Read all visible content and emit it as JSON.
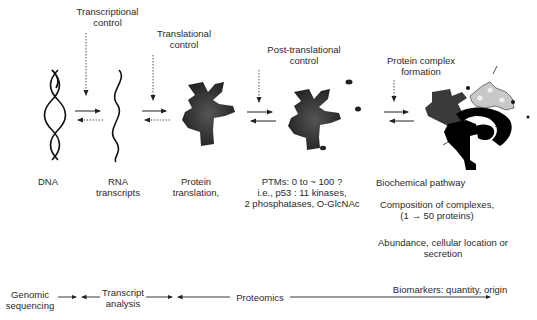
{
  "diagram": {
    "control_labels": [
      {
        "id": "transcriptional",
        "line1": "Transcriptional",
        "line2": "control"
      },
      {
        "id": "translational",
        "line1": "Translational",
        "line2": "control"
      },
      {
        "id": "post_translational",
        "line1": "Post-translational",
        "line2": "control"
      },
      {
        "id": "protein_complex",
        "line1": "Protein complex",
        "line2": "formation"
      }
    ],
    "stages": [
      {
        "id": "dna",
        "line1": "DNA",
        "line2": ""
      },
      {
        "id": "rna",
        "line1": "RNA",
        "line2": "transcripts"
      },
      {
        "id": "protein",
        "line1": "Protein",
        "line2": "translation,"
      }
    ],
    "ptm_notes": {
      "line1": "PTMs: 0 to ~ 100 ?",
      "line2": "i.e., p53 : 11 kinases,",
      "line3": "2 phosphatases, O-GlcNAc"
    },
    "complex_notes": {
      "pathway": "Biochemical pathway",
      "composition_line1": "Composition of complexes,",
      "composition_line2": "(1 → 50 proteins)",
      "abundance_line1": "Abundance, cellular location or",
      "abundance_line2": "secretion"
    },
    "bottom_axis": {
      "genomic_line1": "Genomic",
      "genomic_line2": "sequencing",
      "transcript_line1": "Transcript",
      "transcript_line2": "analysis",
      "proteomics": "Proteomics",
      "biomarkers": "Biomarkers: quantity, origin"
    },
    "colors": {
      "text": "#2a2a2a",
      "protein_dark": "#333333",
      "complex_light": "#c8c8c8",
      "black": "#000000"
    }
  }
}
